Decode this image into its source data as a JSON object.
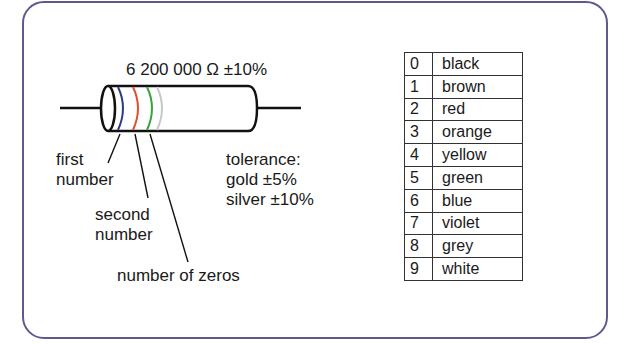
{
  "diagram": {
    "resistor_value_label": "6 200 000  Ω ±10%",
    "bands": [
      {
        "name": "first-band",
        "color_name": "blue",
        "hex": "#2e3a8c",
        "x": 123
      },
      {
        "name": "second-band",
        "color_name": "red",
        "hex": "#e0502e",
        "x": 138
      },
      {
        "name": "multiplier-band",
        "color_name": "green",
        "hex": "#3aa040",
        "x": 152
      },
      {
        "name": "tolerance-band",
        "color_name": "silver/grey",
        "hex": "#c8c8c8",
        "x": 162
      }
    ],
    "labels": {
      "first_line1": "first",
      "first_line2": "number",
      "second_line1": "second",
      "second_line2": "number",
      "zeros": "number of zeros",
      "tolerance_title": "tolerance:",
      "tolerance_gold": "gold ±5%",
      "tolerance_silver": "silver ±10%"
    },
    "frame_color": "#5e5a8e"
  },
  "color_table": {
    "rows": [
      {
        "digit": "0",
        "color": "black"
      },
      {
        "digit": "1",
        "color": "brown"
      },
      {
        "digit": "2",
        "color": "red"
      },
      {
        "digit": "3",
        "color": "orange"
      },
      {
        "digit": "4",
        "color": "yellow"
      },
      {
        "digit": "5",
        "color": "green"
      },
      {
        "digit": "6",
        "color": "blue"
      },
      {
        "digit": "7",
        "color": "violet"
      },
      {
        "digit": "8",
        "color": "grey"
      },
      {
        "digit": "9",
        "color": "white"
      }
    ]
  }
}
